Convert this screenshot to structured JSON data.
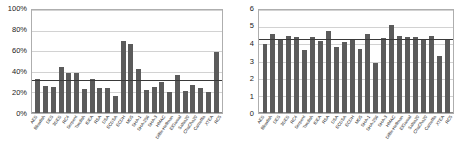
{
  "figure": {
    "panels": [
      "left",
      "right"
    ]
  },
  "chart_data": [
    {
      "type": "bar",
      "panel": "left",
      "title": "",
      "xlabel": "",
      "ylabel": "",
      "ylim": [
        0,
        100
      ],
      "ytick_labels": [
        "0%",
        "20%",
        "40%",
        "60%",
        "80%",
        "100%"
      ],
      "ytick_values": [
        0,
        20,
        40,
        60,
        80,
        100
      ],
      "grid": true,
      "legend": "none",
      "bar_color": "#5b5b5b",
      "average_line": {
        "value": 32,
        "color": "#3a3a3a",
        "label": ""
      },
      "categories": [
        "AES",
        "Blowfish",
        "DES",
        "3DES",
        "RC4",
        "Serpent",
        "Twofish",
        "IDEA",
        "RSA",
        "DSA",
        "ECDSA",
        "ECDH",
        "MD5",
        "SHA-1",
        "SHA-256",
        "SHA-3",
        "HMAC",
        "Diffie-Hellman",
        "ElGamal",
        "Salsa20",
        "ChaCha20",
        "Camellia",
        "XTEA",
        "RC5"
      ],
      "values": [
        33,
        26,
        25,
        45,
        39,
        39,
        23,
        33,
        24,
        24,
        17,
        70,
        67,
        43,
        22,
        25,
        30,
        20,
        37,
        21,
        27,
        24,
        20,
        59
      ]
    },
    {
      "type": "bar",
      "panel": "right",
      "title": "",
      "xlabel": "",
      "ylabel": "",
      "ylim": [
        0,
        6
      ],
      "ytick_labels": [
        "0",
        "1",
        "2",
        "3",
        "4",
        "5",
        "6"
      ],
      "ytick_values": [
        0,
        1,
        2,
        3,
        4,
        5,
        6
      ],
      "grid": true,
      "legend": "none",
      "bar_color": "#5b5b5b",
      "average_line": {
        "value": 4.3,
        "color": "#3a3a3a",
        "label": ""
      },
      "categories": [
        "AES",
        "Blowfish",
        "DES",
        "3DES",
        "RC4",
        "Serpent",
        "Twofish",
        "IDEA",
        "RSA",
        "DSA",
        "ECDSA",
        "ECDH",
        "MD5",
        "SHA-1",
        "SHA-256",
        "SHA-3",
        "HMAC",
        "Diffie-Hellman",
        "ElGamal",
        "Salsa20",
        "ChaCha20",
        "Camellia",
        "XTEA",
        "RC5"
      ],
      "values": [
        4.0,
        4.6,
        4.3,
        4.5,
        4.4,
        3.65,
        4.45,
        4.2,
        4.75,
        3.85,
        4.15,
        4.3,
        3.7,
        4.6,
        2.9,
        4.35,
        5.15,
        4.5,
        4.4,
        4.4,
        4.25,
        4.5,
        3.3,
        4.25
      ]
    }
  ]
}
